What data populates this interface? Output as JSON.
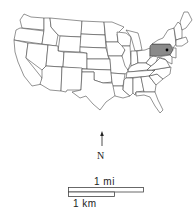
{
  "map": {
    "title": "United States",
    "highlighted_state": "Pennsylvania",
    "highlight_color": "#8a8a8a",
    "marker": {
      "state": "Pennsylvania",
      "shape": "dot",
      "color": "#000000"
    },
    "north_arrow": {
      "label": "N"
    },
    "scale_bar": {
      "mi_label": "1 mi",
      "km_label": "1 km"
    }
  }
}
